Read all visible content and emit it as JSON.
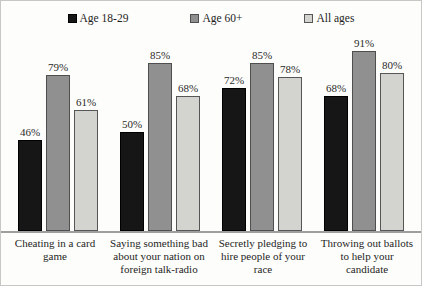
{
  "chart_data": {
    "type": "bar",
    "categories": [
      "Cheating in a card game",
      "Saying something bad about your nation on foreign talk-radio",
      "Secretly pledging to hire people of your race",
      "Throwing out ballots to help your candidate"
    ],
    "series": [
      {
        "name": "Age 18-29",
        "color": "#161616",
        "border_color": "#000000",
        "values": [
          46,
          50,
          72,
          68
        ]
      },
      {
        "name": "Age 60+",
        "color": "#909090",
        "border_color": "#4f4f4f",
        "values": [
          79,
          85,
          85,
          91
        ]
      },
      {
        "name": "All ages",
        "color": "#d3d3d0",
        "border_color": "#565656",
        "values": [
          61,
          68,
          78,
          80
        ]
      }
    ],
    "value_suffix": "%",
    "title": "",
    "xlabel": "",
    "ylabel": "",
    "ylim": [
      0,
      100
    ],
    "grid": false,
    "legend_position": "top",
    "axis_line_color": "#9e9e9e",
    "frame_border_color": "#c9c7c3"
  }
}
